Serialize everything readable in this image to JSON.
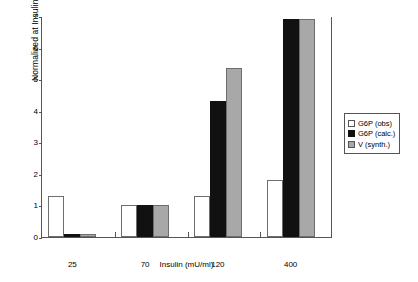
{
  "chart_data": {
    "type": "bar",
    "title": "",
    "xlabel": "Insulin (mU/ml)",
    "ylabel": "Normalized at Insulin = 70",
    "categories": [
      "25",
      "70",
      "120",
      "400"
    ],
    "series": [
      {
        "name": "G6P (obs)",
        "color": "#ffffff",
        "values": [
          1.3,
          1.0,
          1.3,
          1.8
        ]
      },
      {
        "name": "G6P (calc.)",
        "color": "#111111",
        "values": [
          0.1,
          1.0,
          4.3,
          6.9
        ]
      },
      {
        "name": "V (synth.)",
        "color": "#a8a8a8",
        "values": [
          0.1,
          1.0,
          5.35,
          6.9
        ]
      }
    ],
    "ylim": [
      0,
      7
    ],
    "yticks": [
      "0",
      "1",
      "2",
      "3",
      "4",
      "5",
      "6",
      "7"
    ],
    "grid": false,
    "legend_position": "right"
  }
}
